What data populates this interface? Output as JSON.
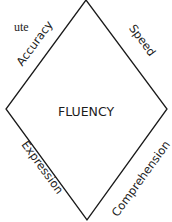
{
  "diagram": {
    "center_label": "FLUENCY",
    "edges": [
      {
        "id": "top-left",
        "label": "Accuracy"
      },
      {
        "id": "top-right",
        "label": "Speed"
      },
      {
        "id": "bottom-left",
        "label": "Expression"
      },
      {
        "id": "bottom-right",
        "label": "Comprehension"
      }
    ],
    "vertices": {
      "top": [
        86,
        0
      ],
      "right": [
        167,
        109
      ],
      "bottom": [
        87,
        220
      ],
      "left": [
        6,
        109
      ]
    },
    "line_color": "#1a1a1a",
    "text_color": "#1c1c1c"
  },
  "cropped_text_fragment": "ute"
}
